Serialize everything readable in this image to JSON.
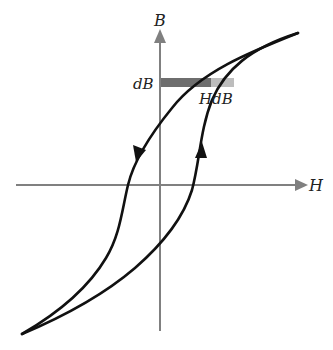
{
  "diagram": {
    "type": "hysteresis-loop",
    "axes": {
      "x_label": "H",
      "y_label": "B"
    },
    "annotations": {
      "dB_label": "dB",
      "HdB_label": "HdB"
    },
    "colors": {
      "axis": "#808080",
      "curve": "#111111",
      "strip_dark": "#6e6e6e",
      "strip_light": "#bdbdbd"
    },
    "branches": [
      {
        "name": "descending-branch",
        "direction": "down"
      },
      {
        "name": "ascending-branch",
        "direction": "up"
      }
    ]
  }
}
